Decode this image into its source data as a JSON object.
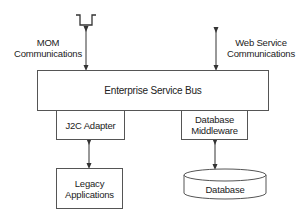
{
  "diagram": {
    "type": "architecture",
    "nodes": {
      "esb": {
        "label": "Enterprise Service Bus"
      },
      "j2c": {
        "label": "J2C Adapter"
      },
      "db_middleware": {
        "line1": "Database",
        "line2": "Middleware"
      },
      "legacy": {
        "line1": "Legacy",
        "line2": "Applications"
      },
      "database": {
        "label": "Database"
      },
      "mom_queue": {
        "icon": "queue-icon"
      }
    },
    "labels": {
      "mom": {
        "line1": "MOM",
        "line2": "Communications"
      },
      "web_service": {
        "line1": "Web Service",
        "line2": "Communications"
      }
    },
    "edges": [
      {
        "from": "mom_queue",
        "to": "esb",
        "label": "MOM Communications",
        "style": "bidirectional"
      },
      {
        "from": "web_service",
        "to": "esb",
        "label": "Web Service Communications",
        "style": "bidirectional"
      },
      {
        "from": "j2c",
        "to": "legacy",
        "style": "bidirectional"
      },
      {
        "from": "db_middleware",
        "to": "database",
        "style": "bidirectional"
      }
    ],
    "colors": {
      "stroke": "#555555",
      "text": "#222222",
      "background": "#ffffff"
    }
  }
}
